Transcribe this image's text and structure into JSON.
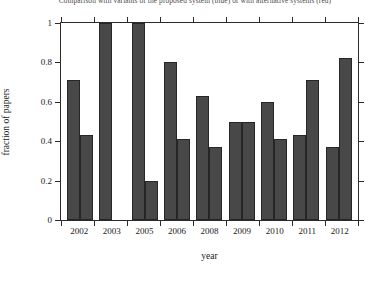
{
  "caption": "Comparison with variants of the proposed system (blue) or with alternative systems (red)",
  "chart_data": {
    "type": "bar",
    "title": "",
    "xlabel": "year",
    "ylabel": "fraction of papers",
    "categories": [
      "2002",
      "2003",
      "2005",
      "2006",
      "2008",
      "2009",
      "2010",
      "2011",
      "2012"
    ],
    "series": [
      {
        "name": "series-1",
        "values": [
          0.71,
          1.0,
          1.0,
          0.8,
          0.63,
          0.5,
          0.6,
          0.43,
          0.37
        ]
      },
      {
        "name": "series-2",
        "values": [
          0.43,
          0.0,
          0.2,
          0.41,
          0.37,
          0.5,
          0.41,
          0.71,
          0.82
        ]
      }
    ],
    "ylim": [
      0,
      1
    ],
    "yticks": [
      "0",
      "0.2",
      "0.4",
      "0.6",
      "0.8",
      "1"
    ],
    "ytick_values": [
      0,
      0.2,
      0.4,
      0.6,
      0.8,
      1
    ],
    "grid": false,
    "legend": "none",
    "bar_color": "#484848",
    "axis_color": "#2b2b2b"
  }
}
